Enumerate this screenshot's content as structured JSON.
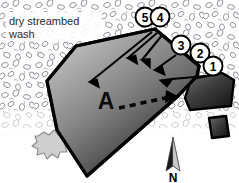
{
  "figure": {
    "name": "site-sketch-map",
    "width": 239,
    "height": 183,
    "background_color": "#ffffff"
  },
  "annotations": {
    "wash_label_line1": "dry streambed",
    "wash_label_line2": "wash",
    "feature_label": "A",
    "north_label": "N"
  },
  "callouts": [
    {
      "id": "callout-1",
      "label": "1",
      "cx": 213,
      "cy": 66,
      "r": 9.5
    },
    {
      "id": "callout-2",
      "label": "2",
      "cx": 200,
      "cy": 53,
      "r": 9.5
    },
    {
      "id": "callout-3",
      "label": "3",
      "cx": 181,
      "cy": 45,
      "r": 9.5
    },
    {
      "id": "callout-4",
      "label": "4",
      "cx": 160,
      "cy": 17,
      "r": 9.5
    },
    {
      "id": "callout-5",
      "label": "5",
      "cx": 145,
      "cy": 17,
      "r": 9.5
    }
  ],
  "colors": {
    "outline": "#000000",
    "feature_fill_light": "#b9b9b9",
    "feature_fill_dark": "#2a2a2a",
    "stipple": "#8d8d99",
    "bush_fill": "#cfcfcf",
    "north_arrow_dark": "#1a1a1a",
    "north_arrow_light": "#c9c9c9",
    "text": "#000000",
    "callout_fill": "#ffffff"
  },
  "elements": {
    "main_feature_name": "feature-a-polygon",
    "secondary_feature_name": "secondary-polygon",
    "tertiary_feature_name": "tertiary-polygon",
    "bush_name": "vegetation-blob",
    "north_arrow_name": "north-arrow",
    "wash_texture_name": "streambed-stipple-texture",
    "dashed_arrow_name": "dashed-direction-arrow"
  }
}
